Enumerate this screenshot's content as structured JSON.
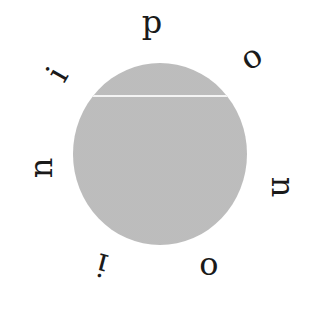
{
  "diagram": {
    "type": "circular-letter-ring",
    "disc": {
      "color": "#c4c4c4",
      "center": [
        160,
        154
      ],
      "diameter": 174,
      "chord_line_y": 96,
      "chord_color": "#f4f4f4"
    },
    "letters": [
      {
        "char": "p",
        "x": 152,
        "y": 22,
        "rotate": 0
      },
      {
        "char": "o",
        "x": 251,
        "y": 57,
        "rotate": -30
      },
      {
        "char": "n",
        "x": 283,
        "y": 187,
        "rotate": 90
      },
      {
        "char": "o",
        "x": 209,
        "y": 264,
        "rotate": 0
      },
      {
        "char": "i",
        "x": 102,
        "y": 265,
        "rotate": 195
      },
      {
        "char": "n",
        "x": 41,
        "y": 168,
        "rotate": -90
      },
      {
        "char": "i",
        "x": 57,
        "y": 74,
        "rotate": -60
      }
    ]
  }
}
